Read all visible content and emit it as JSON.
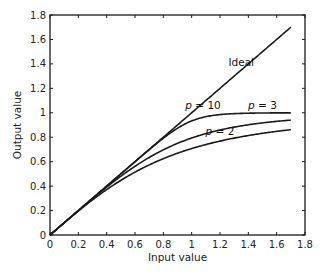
{
  "chart_data": {
    "type": "line",
    "title": "",
    "xlabel": "Input value",
    "ylabel": "Output value",
    "xlim": [
      0,
      1.8
    ],
    "ylim": [
      0,
      1.8
    ],
    "xticks": [
      0,
      0.2,
      0.4,
      0.6,
      0.8,
      1,
      1.2,
      1.4,
      1.6,
      1.8
    ],
    "yticks": [
      0,
      0.2,
      0.4,
      0.6,
      0.8,
      1,
      1.2,
      1.4,
      1.6,
      1.8
    ],
    "xtick_labels": [
      "0",
      "0.2",
      "0.4",
      "0.6",
      "0.8",
      "1",
      "1.2",
      "1.4",
      "1.6",
      "1.8"
    ],
    "ytick_labels": [
      "0",
      "0.2",
      "0.4",
      "0.6",
      "0.8",
      "1",
      "1.2",
      "1.4",
      "1.6",
      "1.8"
    ],
    "grid": false,
    "legend": "none (inline annotations)",
    "x": [
      0,
      0.2,
      0.4,
      0.6,
      0.8,
      0.9,
      1.0,
      1.1,
      1.2,
      1.4,
      1.6,
      1.7
    ],
    "series": [
      {
        "name": "Ideal",
        "values": [
          0,
          0.2,
          0.4,
          0.6,
          0.8,
          0.9,
          1.0,
          1.1,
          1.2,
          1.4,
          1.6,
          1.7
        ]
      },
      {
        "name": "p = 10",
        "p": 10,
        "values": [
          0,
          0.2,
          0.4,
          0.6,
          0.8,
          0.87,
          0.93,
          0.96,
          0.98,
          0.99,
          1.0,
          1.0
        ]
      },
      {
        "name": "p = 3",
        "p": 3,
        "values": [
          0,
          0.2,
          0.4,
          0.59,
          0.74,
          0.79,
          0.79,
          0.86,
          0.89,
          0.94,
          0.96,
          0.97
        ]
      },
      {
        "name": "p = 2",
        "p": 2,
        "values": [
          0,
          0.2,
          0.37,
          0.51,
          0.62,
          0.67,
          0.71,
          0.74,
          0.77,
          0.81,
          0.85,
          0.86
        ]
      }
    ],
    "annotations": [
      {
        "text": "Ideal",
        "x": 1.35,
        "y": 1.38
      },
      {
        "text": "p = 10",
        "x": 1.08,
        "y": 1.03
      },
      {
        "text": "p = 3",
        "x": 1.5,
        "y": 1.03
      },
      {
        "text": "p = 2",
        "x": 1.2,
        "y": 0.82
      }
    ],
    "curve_formula": "y = x / (1 + x^p)^(1/p)",
    "x_max": 1.7
  },
  "colors": {
    "line": "#1a1a1a",
    "axis": "#1a1a1a",
    "text": "#222222",
    "background": "#ffffff"
  }
}
